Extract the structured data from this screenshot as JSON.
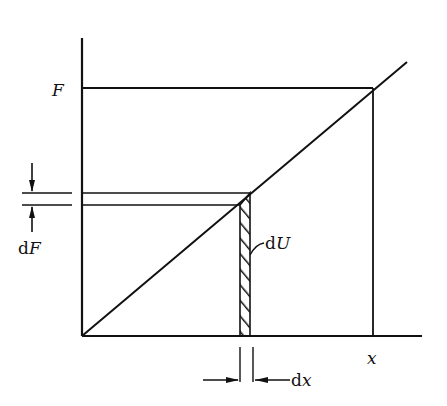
{
  "diagram": {
    "type": "force-displacement work diagram",
    "labels": {
      "F": "F",
      "dF_d": "d",
      "dF_F": "F",
      "dU_d": "d",
      "dU_U": "U",
      "dx_d": "d",
      "dx_x": "x",
      "x": "x"
    },
    "colors": {
      "line": "#111111",
      "background": "#ffffff"
    }
  }
}
